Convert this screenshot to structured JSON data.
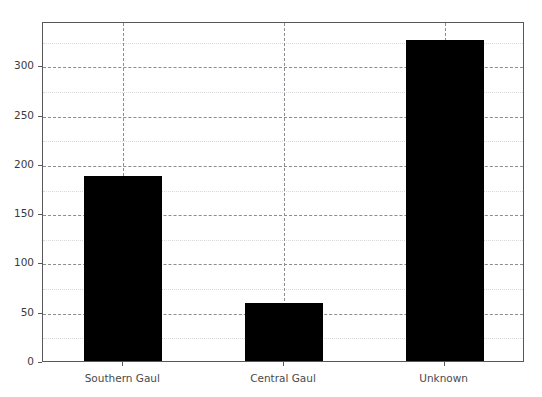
{
  "chart_data": {
    "type": "bar",
    "title": "",
    "subtitle": "",
    "xlabel": "",
    "ylabel": "",
    "categories": [
      "Southern Gaul",
      "Central Gaul",
      "Unknown"
    ],
    "values": [
      188,
      59,
      326
    ],
    "series": [
      {
        "name": "count",
        "values": [
          188,
          59,
          326
        ],
        "color": "#000000"
      }
    ],
    "ylim": [
      0,
      345
    ],
    "xlim": [
      0,
      3
    ],
    "yticks": [
      0,
      50,
      100,
      150,
      200,
      250,
      300
    ],
    "ytick_labels": [
      "0",
      "50",
      "100",
      "150",
      "200",
      "250",
      "300"
    ],
    "yminor_ticks": [
      25,
      75,
      125,
      175,
      225,
      275,
      325
    ],
    "xtick_labels": [
      "Southern Gaul",
      "Central Gaul",
      "Unknown"
    ],
    "grid": {
      "major_enabled": true,
      "minor_enabled": true,
      "major_color": "#8d8d90",
      "minor_color": "#d8d8dc",
      "major_style": "dashed",
      "minor_style": "dotted",
      "vertical_major_enabled": true
    },
    "legend": {
      "visible": false,
      "position": "none",
      "entries": []
    },
    "axes": {
      "frame_color": "#58585a",
      "background_color": "#ffffff",
      "tick_label_color": "#3b3b3d"
    },
    "annotations": []
  },
  "figure": {
    "background_color": "#ffffff",
    "width": 542,
    "height": 397
  }
}
